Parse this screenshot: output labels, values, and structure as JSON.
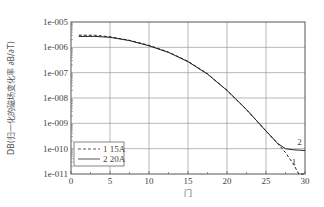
{
  "chart_data": {
    "type": "line",
    "title": "",
    "xlabel": "门",
    "ylabel": "DB(归一化的磁场变化率 ∂B/∂T)",
    "yscale": "log",
    "xlim": [
      0,
      30
    ],
    "ylim": [
      1e-11,
      1e-05
    ],
    "x_ticks": [
      "0",
      "5",
      "10",
      "15",
      "20",
      "25",
      "30"
    ],
    "y_ticks": [
      "1e-011",
      "1e-010",
      "1e-009",
      "1e-008",
      "1e-007",
      "1e-006",
      "1e-005"
    ],
    "grid": true,
    "legend_position": "lower left",
    "series": [
      {
        "name": "1 15A",
        "style": "dashed",
        "label": "1",
        "x": [
          1,
          3,
          5,
          7.5,
          10,
          12.5,
          15,
          17.5,
          20,
          22.5,
          25,
          26.5,
          27.5,
          28.5,
          29.2,
          29.7,
          30
        ],
        "y": [
          3e-06,
          3e-06,
          2.6e-06,
          1.9e-06,
          1.2e-06,
          6.5e-07,
          2.8e-07,
          9e-08,
          2e-08,
          3.5e-09,
          5e-10,
          1.6e-10,
          7e-11,
          2.5e-11,
          9e-12,
          4e-12,
          1.2e-12
        ]
      },
      {
        "name": "2 20A",
        "style": "solid",
        "label": "2",
        "x": [
          1,
          3,
          5,
          7.5,
          10,
          12.5,
          15,
          17.5,
          20,
          22.5,
          25,
          26.5,
          27.5,
          28.5,
          29.2,
          30
        ],
        "y": [
          2.7e-06,
          2.7e-06,
          2.5e-06,
          1.85e-06,
          1.15e-06,
          6.3e-07,
          2.7e-07,
          8.8e-08,
          2e-08,
          3.5e-09,
          5e-10,
          1.6e-10,
          1e-10,
          9e-11,
          8.8e-11,
          8.5e-11
        ]
      }
    ]
  },
  "legend": {
    "items": [
      {
        "label": "1 15A",
        "style": "dashed"
      },
      {
        "label": "2 20A",
        "style": "solid"
      }
    ]
  },
  "annotations": {
    "curve1": "1",
    "curve2": "2"
  }
}
